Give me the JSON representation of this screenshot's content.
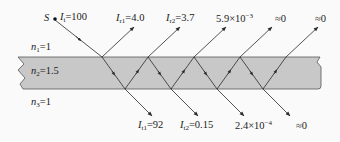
{
  "diagram": {
    "colors": {
      "slab_fill": "#c8c8c8",
      "slab_edge": "#555555",
      "ray": "#2a2a2a",
      "background": "#fafafa"
    },
    "media": [
      {
        "name": "n1",
        "symbol": "n",
        "sub": "1",
        "value": "=1"
      },
      {
        "name": "n2",
        "symbol": "n",
        "sub": "2",
        "value": "=1.5"
      },
      {
        "name": "n3",
        "symbol": "n",
        "sub": "3",
        "value": "=1"
      }
    ],
    "source": {
      "label": "S",
      "intensity_symbol": "I",
      "intensity_sub": "i",
      "intensity_value": "=100"
    },
    "reflected": [
      {
        "symbol": "I",
        "sub": "r1",
        "value": "=4.0"
      },
      {
        "symbol": "I",
        "sub": "r2",
        "value": "=3.7"
      },
      {
        "symbol": "",
        "sub": "",
        "value": "5.9×10",
        "exp": "−3"
      },
      {
        "symbol": "",
        "sub": "",
        "value": "≈0"
      },
      {
        "symbol": "",
        "sub": "",
        "value": "≈0"
      }
    ],
    "transmitted": [
      {
        "symbol": "I",
        "sub": "t1",
        "value": "=92"
      },
      {
        "symbol": "I",
        "sub": "t2",
        "value": "=0.15"
      },
      {
        "symbol": "",
        "sub": "",
        "value": "2.4×10",
        "exp": "−4"
      },
      {
        "symbol": "",
        "sub": "",
        "value": "≈0"
      }
    ]
  }
}
